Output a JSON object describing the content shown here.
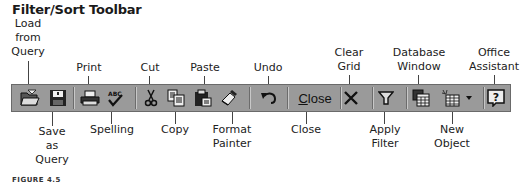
{
  "title": "Filter/Sort Toolbar",
  "caption": "FIGURE 4.5",
  "colors": {
    "toolbar_bg": "#9a9a9a",
    "toolbar_border": "#6a6a6a",
    "icon": "#1a1a1a"
  },
  "top_labels": [
    {
      "id": "load-from-query",
      "lines": [
        "Load",
        "from",
        "Query"
      ]
    },
    {
      "id": "print",
      "lines": [
        "Print"
      ]
    },
    {
      "id": "cut",
      "lines": [
        "Cut"
      ]
    },
    {
      "id": "paste",
      "lines": [
        "Paste"
      ]
    },
    {
      "id": "undo",
      "lines": [
        "Undo"
      ]
    },
    {
      "id": "clear-grid",
      "lines": [
        "Clear",
        "Grid"
      ]
    },
    {
      "id": "database-window",
      "lines": [
        "Database",
        "Window"
      ]
    },
    {
      "id": "office-assistant",
      "lines": [
        "Office",
        "Assistant"
      ]
    }
  ],
  "bottom_labels": [
    {
      "id": "save-as-query",
      "lines": [
        "Save",
        "as",
        "Query"
      ]
    },
    {
      "id": "spelling",
      "lines": [
        "Spelling"
      ]
    },
    {
      "id": "copy",
      "lines": [
        "Copy"
      ]
    },
    {
      "id": "format-painter",
      "lines": [
        "Format",
        "Painter"
      ]
    },
    {
      "id": "close",
      "lines": [
        "Close"
      ]
    },
    {
      "id": "apply-filter",
      "lines": [
        "Apply",
        "Filter"
      ]
    },
    {
      "id": "new-object",
      "lines": [
        "New",
        "Object"
      ]
    }
  ],
  "toolbar": {
    "buttons": [
      {
        "name": "load-from-query",
        "icon": "open-folder-icon"
      },
      {
        "name": "save-as-query",
        "icon": "floppy-disk-icon"
      },
      {
        "name": "print",
        "icon": "printer-icon"
      },
      {
        "name": "spelling",
        "icon": "spell-check-icon"
      },
      {
        "name": "cut",
        "icon": "scissors-icon"
      },
      {
        "name": "copy",
        "icon": "copy-icon"
      },
      {
        "name": "paste",
        "icon": "clipboard-icon"
      },
      {
        "name": "format-painter",
        "icon": "paintbrush-icon"
      },
      {
        "name": "undo",
        "icon": "undo-arrow-icon"
      },
      {
        "name": "close",
        "icon": "text",
        "text_first": "C",
        "text_rest": "lose"
      },
      {
        "name": "clear-grid",
        "icon": "x-icon"
      },
      {
        "name": "apply-filter",
        "icon": "funnel-icon"
      },
      {
        "name": "database-window",
        "icon": "database-window-icon"
      },
      {
        "name": "new-object",
        "icon": "new-table-icon",
        "dropdown": "chevron-down-icon"
      },
      {
        "name": "office-assistant",
        "icon": "help-question-icon"
      }
    ]
  }
}
